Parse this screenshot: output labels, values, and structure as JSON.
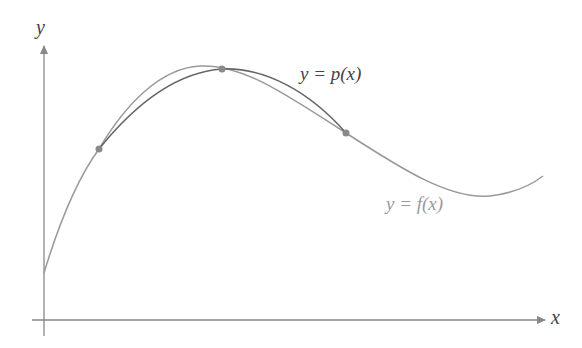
{
  "diagram": {
    "type": "function-interpolation",
    "axes": {
      "x_label": "x",
      "y_label": "y",
      "color": "#888888"
    },
    "curves": [
      {
        "id": "f",
        "label": "y = f(x)",
        "color": "#999999",
        "label_color": "#9a9a9a"
      },
      {
        "id": "p",
        "label": "y = p(x)",
        "color": "#666666",
        "label_color": "#444444"
      }
    ],
    "interpolation_points": [
      {
        "x": 99,
        "y": 149
      },
      {
        "x": 222,
        "y": 69
      },
      {
        "x": 346,
        "y": 133
      }
    ],
    "point_color": "#8a8a8a"
  }
}
